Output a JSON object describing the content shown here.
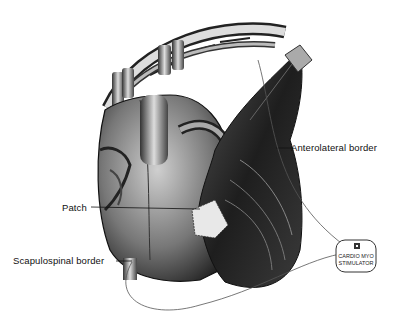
{
  "figure": {
    "labels": {
      "anterolateral": "Anterolateral border",
      "patch": "Patch",
      "scapulospinal": "Scapulospinal border"
    },
    "device": {
      "line1": "CARDIO MYO",
      "line2": "STIMULATOR"
    },
    "colors": {
      "background": "#ffffff",
      "ink": "#111111",
      "muscle_dark": "#2a2a2a",
      "heart_mid": "#7a7a7a",
      "lead_wire": "#555555"
    }
  }
}
